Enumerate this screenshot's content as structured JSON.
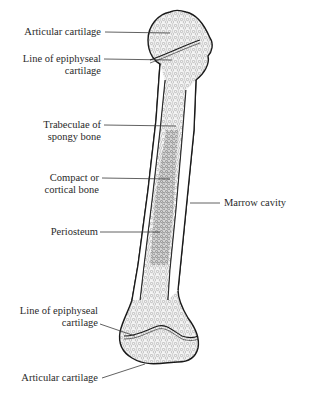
{
  "diagram": {
    "labels": {
      "articular_cartilage_top": "Articular cartilage",
      "epiphyseal_top_line1": "Line of epiphyseal",
      "epiphyseal_top_line2": "cartilage",
      "trabeculae_line1": "Trabeculae of",
      "trabeculae_line2": "spongy bone",
      "compact_line1": "Compact or",
      "compact_line2": "cortical bone",
      "marrow_cavity": "Marrow cavity",
      "periosteum": "Periosteum",
      "epiphyseal_bottom_line1": "Line of epiphyseal",
      "epiphyseal_bottom_line2": "cartilage",
      "articular_cartilage_bottom": "Articular cartilage"
    },
    "colors": {
      "outline": "#1a1a1a",
      "leader": "#3a3a3a",
      "text": "#2a2a2a",
      "spongy_fill": "#f2f2f2",
      "marrow_fill": "#d8d8d8"
    }
  }
}
